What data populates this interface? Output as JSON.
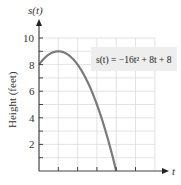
{
  "chart_data": {
    "type": "line",
    "title": "",
    "function_label": "s(t) = −16t² + 8t + 8",
    "xlabel": "t",
    "ylabel": "Height (feet)",
    "y_axis_var": "s(t)",
    "xlim": [
      0,
      1.5
    ],
    "ylim": [
      0,
      10.5
    ],
    "x_grid_step": 0.25,
    "y_grid_step": 1,
    "y_tick_labels": [
      "2",
      "4",
      "6",
      "8",
      "10"
    ],
    "y_ticks": [
      2,
      4,
      6,
      8,
      10
    ],
    "x_tick_labels": [],
    "grid": true,
    "series": [
      {
        "name": "s(t) = -16t^2 + 8t + 8",
        "x": [
          0,
          0.125,
          0.25,
          0.375,
          0.5,
          0.625,
          0.75,
          0.875,
          1.0
        ],
        "values": [
          8,
          8.75,
          9,
          8.75,
          8,
          6.75,
          5,
          2.75,
          0
        ]
      }
    ],
    "colors": {
      "curve": "#7a7a7a",
      "grid": "#dcdcdc",
      "axis": "#444444",
      "label_box": "#eeeeee"
    }
  }
}
